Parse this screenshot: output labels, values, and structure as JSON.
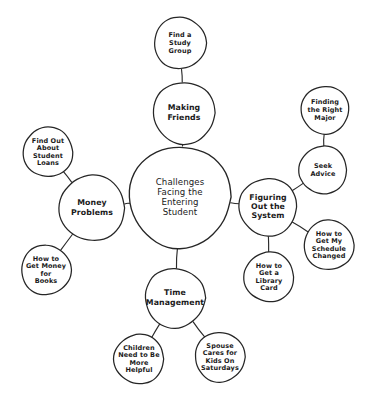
{
  "diagram": {
    "type": "mind-map",
    "style": "hand-drawn",
    "background_color": "#ffffff",
    "ink_color": "#262626",
    "center": {
      "id": "center",
      "label": "Challenges Facing the Entering Student",
      "lines": [
        "Challenges",
        "Facing the",
        "Entering",
        "Student"
      ],
      "cx": 180,
      "cy": 197,
      "r": 51,
      "level": "center"
    },
    "nodes": [
      {
        "id": "making-friends",
        "label": "Making Friends",
        "lines": [
          "Making",
          "Friends"
        ],
        "cx": 184,
        "cy": 113,
        "r": 31,
        "level": "primary",
        "parent": "center"
      },
      {
        "id": "find-a-study-group",
        "label": "Find a Study Group",
        "lines": [
          "Find a",
          "Study",
          "Group"
        ],
        "cx": 180,
        "cy": 43,
        "r": 26,
        "level": "leaf",
        "parent": "making-friends"
      },
      {
        "id": "money-problems",
        "label": "Money Problems",
        "lines": [
          "Money",
          "Problems"
        ],
        "cx": 92,
        "cy": 208,
        "r": 33,
        "level": "primary",
        "parent": "center"
      },
      {
        "id": "find-out-about-student-loans",
        "label": "Find Out About Student Loans",
        "lines": [
          "Find Out",
          "About",
          "Student",
          "Loans"
        ],
        "cx": 48,
        "cy": 152,
        "r": 25,
        "level": "leaf",
        "parent": "money-problems"
      },
      {
        "id": "how-to-get-money-for-books",
        "label": "How to Get Money for Books",
        "lines": [
          "How to",
          "Get Money",
          "for",
          "Books"
        ],
        "cx": 46,
        "cy": 270,
        "r": 25,
        "level": "leaf",
        "parent": "money-problems"
      },
      {
        "id": "figuring-out-the-system",
        "label": "Figuring Out the System",
        "lines": [
          "Figuring",
          "Out the",
          "System"
        ],
        "cx": 268,
        "cy": 207,
        "r": 29,
        "level": "primary",
        "parent": "center"
      },
      {
        "id": "seek-advice",
        "label": "Seek Advice",
        "lines": [
          "Seek",
          "Advice"
        ],
        "cx": 323,
        "cy": 170,
        "r": 24,
        "level": "leaf",
        "parent": "figuring-out-the-system"
      },
      {
        "id": "finding-the-right-major",
        "label": "Finding the Right Major",
        "lines": [
          "Finding",
          "the Right",
          "Major"
        ],
        "cx": 325,
        "cy": 110,
        "r": 24,
        "level": "leaf",
        "parent": "seek-advice"
      },
      {
        "id": "how-to-get-my-schedule-changed",
        "label": "How to Get My Schedule Changed",
        "lines": [
          "How to",
          "Get My",
          "Schedule",
          "Changed"
        ],
        "cx": 329,
        "cy": 245,
        "r": 25,
        "level": "leaf",
        "parent": "figuring-out-the-system"
      },
      {
        "id": "how-to-get-a-library-card",
        "label": "How to Get a Library Card",
        "lines": [
          "How to",
          "Get a",
          "Library",
          "Card"
        ],
        "cx": 269,
        "cy": 277,
        "r": 25,
        "level": "leaf",
        "parent": "figuring-out-the-system"
      },
      {
        "id": "time-management",
        "label": "Time Management",
        "lines": [
          "Time",
          "Management"
        ],
        "cx": 175,
        "cy": 298,
        "r": 30,
        "level": "primary",
        "parent": "center"
      },
      {
        "id": "children-need-to-be-more-helpful",
        "label": "Children Need to Be More Helpful",
        "lines": [
          "Children",
          "Need to Be",
          "More",
          "Helpful"
        ],
        "cx": 139,
        "cy": 359,
        "r": 25,
        "level": "leaf",
        "parent": "time-management"
      },
      {
        "id": "spouse-cares-for-kids-on-saturdays",
        "label": "Spouse Cares for Kids On Saturdays",
        "lines": [
          "Spouse",
          "Cares for",
          "Kids On",
          "Saturdays"
        ],
        "cx": 220,
        "cy": 357,
        "r": 25,
        "level": "leaf",
        "parent": "time-management"
      }
    ]
  }
}
